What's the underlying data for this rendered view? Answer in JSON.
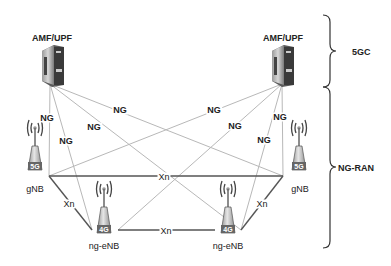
{
  "nodes": {
    "amf_left": {
      "label": "AMF/UPF"
    },
    "amf_right": {
      "label": "AMF/UPF"
    },
    "gnb_left": {
      "label": "gNB",
      "badge": "5G"
    },
    "gnb_right": {
      "label": "gNB",
      "badge": "5G"
    },
    "ngenb_left": {
      "label": "ng-eNB",
      "badge": "4G"
    },
    "ngenb_right": {
      "label": "ng-eNB",
      "badge": "4G"
    }
  },
  "links": {
    "ng_label": "NG",
    "xn_label": "Xn"
  },
  "regions": {
    "core": "5GC",
    "ran": "NG-RAN"
  },
  "colors": {
    "ng_line": "#b5b5b5",
    "xn_line": "#555555",
    "text": "#222222"
  }
}
